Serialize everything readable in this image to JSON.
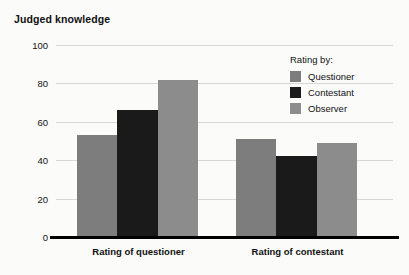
{
  "chart_data": {
    "type": "bar",
    "title": "Judged knowledge",
    "xlabel": "",
    "ylabel": "",
    "ylim": [
      0,
      100
    ],
    "yticks": [
      0,
      20,
      40,
      60,
      80,
      100
    ],
    "ytick_labels": [
      "0",
      "20",
      "40",
      "60",
      "80",
      "100"
    ],
    "grid": true,
    "grouping": "grouped",
    "legend_position": "top-right",
    "legend_title": "Rating by:",
    "categories": [
      "Rating of questioner",
      "Rating of contestant"
    ],
    "series": [
      {
        "name": "Questioner",
        "color": "#7d7d7d",
        "values": [
          53,
          51
        ]
      },
      {
        "name": "Contestant",
        "color": "#1a1a1a",
        "values": [
          66,
          42
        ]
      },
      {
        "name": "Observer",
        "color": "#8c8c8c",
        "values": [
          82,
          49
        ]
      }
    ]
  },
  "colors": {
    "background": "#fbfbfa",
    "axis": "#000000",
    "gridline": "#d6d6d6",
    "text": "#111111"
  }
}
